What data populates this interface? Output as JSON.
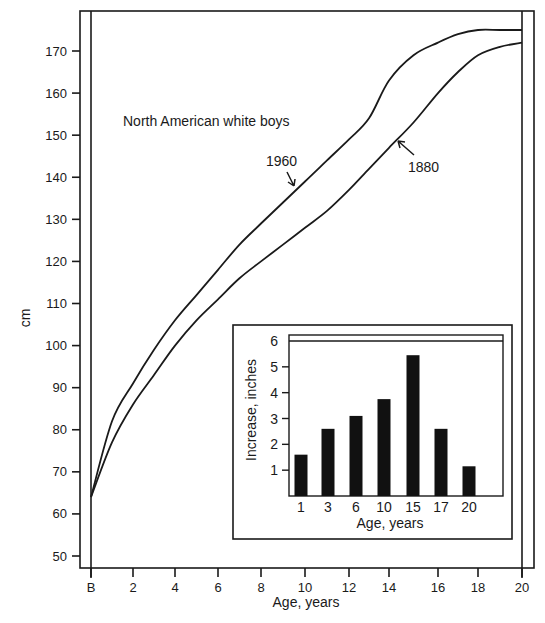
{
  "chart_data": [
    {
      "type": "line",
      "title": "",
      "annotation": "North American white boys",
      "xlabel": "Age, years",
      "ylabel": "cm",
      "x_ticks": [
        "B",
        "2",
        "4",
        "6",
        "8",
        "10",
        "12",
        "14",
        "16",
        "18",
        "20"
      ],
      "y_ticks": [
        50,
        60,
        70,
        80,
        90,
        100,
        110,
        120,
        130,
        140,
        150,
        160,
        170
      ],
      "xlim": [
        0,
        20
      ],
      "ylim": [
        45,
        178
      ],
      "grid": false,
      "legend": "inline labels with arrows",
      "x": [
        0,
        1,
        2,
        3,
        4,
        5,
        6,
        7,
        8,
        9,
        10,
        11,
        12,
        13,
        14,
        15,
        16,
        17,
        18,
        19,
        20
      ],
      "series": [
        {
          "name": "1960",
          "values": [
            64,
            82,
            91,
            99,
            106,
            112,
            118,
            124,
            129,
            134,
            139,
            144,
            149,
            154,
            163,
            169,
            172,
            174,
            175,
            175,
            175
          ]
        },
        {
          "name": "1880",
          "values": [
            64,
            77,
            86,
            93,
            100,
            106,
            111,
            116,
            120,
            124,
            128,
            132,
            137,
            142,
            147,
            153,
            160,
            165,
            169,
            171,
            172
          ]
        }
      ]
    },
    {
      "type": "bar",
      "title": "",
      "xlabel": "Age, years",
      "ylabel": "Increase, inches",
      "categories": [
        "1",
        "3",
        "6",
        "10",
        "15",
        "17",
        "20"
      ],
      "values": [
        1.6,
        2.6,
        3.1,
        3.75,
        5.45,
        2.6,
        1.15
      ],
      "y_ticks": [
        1,
        2,
        3,
        4,
        5,
        6
      ],
      "ylim": [
        0,
        6
      ],
      "grid": false,
      "legend": "none"
    }
  ]
}
